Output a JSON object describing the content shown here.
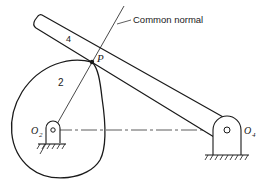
{
  "diagram": {
    "type": "cam-follower mechanism",
    "labels": {
      "common_normal": "Common normal",
      "contact_point": "P",
      "link_4": "4",
      "cam_2": "2",
      "pivot_cam": "O",
      "pivot_cam_sub": "2",
      "pivot_follower": "O",
      "pivot_follower_sub": "4"
    },
    "colors": {
      "stroke": "#1a1a1a",
      "background": "#ffffff"
    }
  }
}
